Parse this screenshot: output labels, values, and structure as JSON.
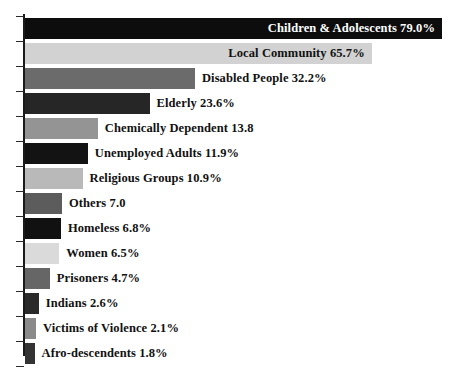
{
  "chart": {
    "type": "bar",
    "orientation": "horizontal",
    "title": "",
    "xlabel": "",
    "ylabel": "",
    "background_color": "#ffffff",
    "axis_color": "#1a1a1a",
    "xlim": [
      0,
      79
    ],
    "grid": false,
    "legend": "none",
    "value_labels_position": "inside-or-right-of-bar"
  },
  "chart_data": {
    "type": "bar",
    "title": "",
    "xlabel": "",
    "ylabel": "",
    "grid": false,
    "legend": "none",
    "xlim": [
      0,
      79
    ],
    "categories": [
      "Children & Adolescents",
      "Local Community",
      "Disabled People",
      "Elderly",
      "Chemically Dependent",
      "Unemployed Adults",
      "Religious Groups",
      "Others",
      "Homeless",
      "Women",
      "Prisoners",
      "Indians",
      "Victims of Violence",
      "Afro-descendents"
    ],
    "values": [
      79.0,
      65.7,
      32.2,
      23.6,
      13.8,
      11.9,
      10.9,
      7.0,
      6.8,
      6.5,
      4.7,
      2.6,
      2.1,
      1.8
    ],
    "bars": [
      {
        "category": "Children & Adolescents",
        "value": 79.0,
        "label": "Children & Adolescents 79.0%",
        "color": "#0d0d0d",
        "label_color": "#ffffff",
        "label_inside": true
      },
      {
        "category": "Local Community",
        "value": 65.7,
        "label": "Local Community 65.7%",
        "color": "#d2d2d2",
        "label_color": "#111111",
        "label_inside": true
      },
      {
        "category": "Disabled People",
        "value": 32.2,
        "label": "Disabled People 32.2%",
        "color": "#6b6b6b",
        "label_color": "#111111",
        "label_inside": false
      },
      {
        "category": "Elderly",
        "value": 23.6,
        "label": "Elderly 23.6%",
        "color": "#262626",
        "label_color": "#111111",
        "label_inside": false
      },
      {
        "category": "Chemically Dependent",
        "value": 13.8,
        "label": "Chemically Dependent 13.8",
        "color": "#949494",
        "label_color": "#111111",
        "label_inside": false
      },
      {
        "category": "Unemployed Adults",
        "value": 11.9,
        "label": "Unemployed Adults 11.9%",
        "color": "#131313",
        "label_color": "#111111",
        "label_inside": false
      },
      {
        "category": "Religious Groups",
        "value": 10.9,
        "label": "Religious Groups 10.9%",
        "color": "#b9b9b9",
        "label_color": "#111111",
        "label_inside": false
      },
      {
        "category": "Others",
        "value": 7.0,
        "label": "Others 7.0",
        "color": "#5c5c5c",
        "label_color": "#111111",
        "label_inside": false
      },
      {
        "category": "Homeless",
        "value": 6.8,
        "label": "Homeless 6.8%",
        "color": "#111111",
        "label_color": "#111111",
        "label_inside": false
      },
      {
        "category": "Women",
        "value": 6.5,
        "label": "Women 6.5%",
        "color": "#dadada",
        "label_color": "#111111",
        "label_inside": false
      },
      {
        "category": "Prisoners",
        "value": 4.7,
        "label": "Prisoners 4.7%",
        "color": "#666666",
        "label_color": "#111111",
        "label_inside": false
      },
      {
        "category": "Indians",
        "value": 2.6,
        "label": "Indians 2.6%",
        "color": "#2a2a2a",
        "label_color": "#111111",
        "label_inside": false
      },
      {
        "category": "Victims of Violence",
        "value": 2.1,
        "label": "Victims of Violence 2.1%",
        "color": "#8a8a8a",
        "label_color": "#111111",
        "label_inside": false
      },
      {
        "category": "Afro-descendents",
        "value": 1.8,
        "label": "Afro-descendents 1.8%",
        "color": "#333333",
        "label_color": "#111111",
        "label_inside": false
      }
    ]
  }
}
